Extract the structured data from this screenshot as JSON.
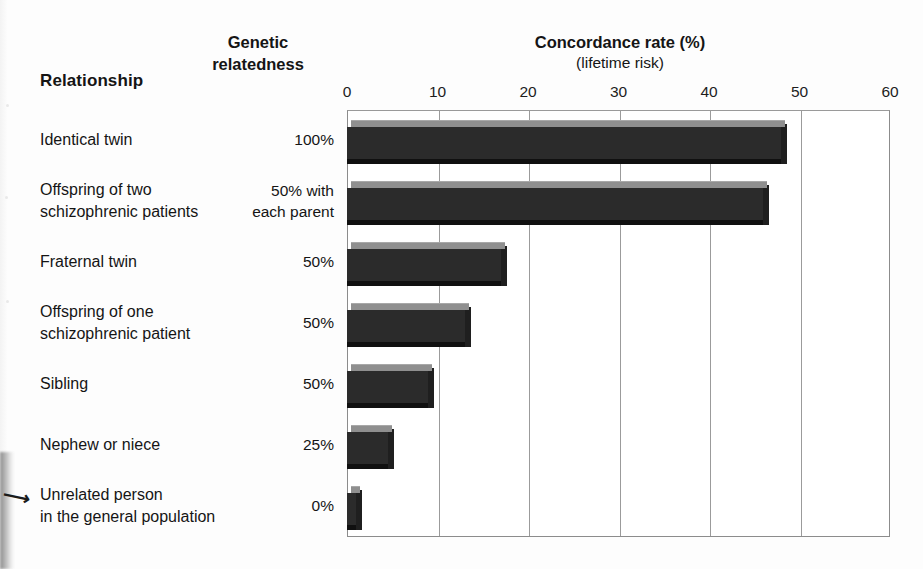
{
  "headers": {
    "relationship": "Relationship",
    "genetic_relatedness": "Genetic\nrelatedness",
    "concordance_title": "Concordance rate (%)",
    "concordance_sub": "(lifetime risk)"
  },
  "chart_data": {
    "type": "bar",
    "orientation": "horizontal",
    "title": "Concordance rate (%)",
    "subtitle": "(lifetime risk)",
    "xlabel": "Concordance rate (%)",
    "ylabel": "Relationship",
    "xlim": [
      0,
      60
    ],
    "xticks": [
      0,
      10,
      20,
      30,
      40,
      50,
      60
    ],
    "xtick_labels": [
      "0",
      "10",
      "20",
      "30",
      "40",
      "50",
      "60"
    ],
    "grid": true,
    "grid_axis": "x",
    "legend": "none",
    "bar_color": "#2b2b2b",
    "bar_top_color": "#8f8f8f",
    "categories": [
      "Identical twin",
      "Offspring of two schizophrenic patients",
      "Fraternal twin",
      "Offspring of one schizophrenic patient",
      "Sibling",
      "Nephew or niece",
      "Unrelated person in the general population"
    ],
    "values": [
      48,
      46,
      17,
      13,
      9,
      4.5,
      1
    ],
    "genetic_relatedness": [
      "100%",
      "50% with each parent",
      "50%",
      "50%",
      "50%",
      "25%",
      "0%"
    ]
  },
  "rows": [
    {
      "relationship": "Identical twin",
      "relatedness": "100%",
      "value": 48
    },
    {
      "relationship": "Offspring of two\nschizophrenic patients",
      "relatedness": "50% with\neach parent",
      "value": 46
    },
    {
      "relationship": "Fraternal twin",
      "relatedness": "50%",
      "value": 17
    },
    {
      "relationship": "Offspring of one\nschizophrenic patient",
      "relatedness": "50%",
      "value": 13
    },
    {
      "relationship": "Sibling",
      "relatedness": "50%",
      "value": 9
    },
    {
      "relationship": "Nephew or niece",
      "relatedness": "25%",
      "value": 4.5
    },
    {
      "relationship": "Unrelated person\nin the general population",
      "relatedness": "0%",
      "value": 1
    }
  ]
}
